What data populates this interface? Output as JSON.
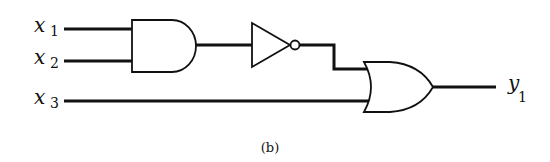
{
  "diagram": {
    "type": "logic-circuit",
    "caption": "(b)",
    "inputs": [
      {
        "var": "x",
        "sub": "1"
      },
      {
        "var": "x",
        "sub": "2"
      },
      {
        "var": "x",
        "sub": "3"
      }
    ],
    "output": {
      "var": "y",
      "sub": "1"
    },
    "gates": [
      {
        "type": "AND",
        "inputs": [
          "x1",
          "x2"
        ]
      },
      {
        "type": "NOT",
        "inputs": [
          "AND"
        ]
      },
      {
        "type": "OR",
        "inputs": [
          "NOT",
          "x3"
        ]
      }
    ],
    "colors": {
      "stroke": "#111111",
      "background": "#ffffff"
    }
  }
}
